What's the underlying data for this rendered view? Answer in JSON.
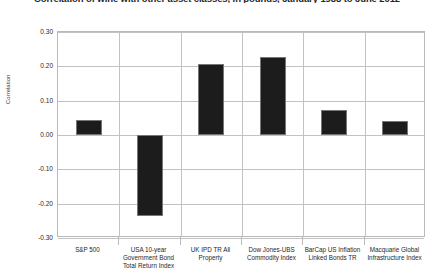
{
  "chart_data": {
    "type": "bar",
    "title": "Correlation of wine with other asset classes, in pounds, January 1988 to June 2012",
    "xlabel": "",
    "ylabel": "Correlation",
    "categories": [
      "S&P 500",
      "USA 10-year Government Bond Total Return Index",
      "UK IPD TR All Property",
      "Dow Jones-UBS Commodity Index",
      "BarCap US Inflation Linked Bonds TR",
      "Macquarie Global Infrastructure Index"
    ],
    "values": [
      0.045,
      -0.236,
      0.207,
      0.228,
      0.073,
      0.042
    ],
    "ylim": [
      -0.3,
      0.3
    ],
    "ytick_labels": [
      "0.30",
      "0.20",
      "0.10",
      "0.00",
      "-0.10",
      "-0.20",
      "-0.30"
    ],
    "ytick_values": [
      0.3,
      0.2,
      0.1,
      0.0,
      -0.1,
      -0.2,
      -0.3
    ],
    "grid": "horizontal-and-vertical",
    "legend": "none",
    "bar_color": "#1c1c1c",
    "bar_edge_color": "#767676",
    "grid_color": "#c2c2c2",
    "plot_border_color": "#b9b9b9"
  }
}
